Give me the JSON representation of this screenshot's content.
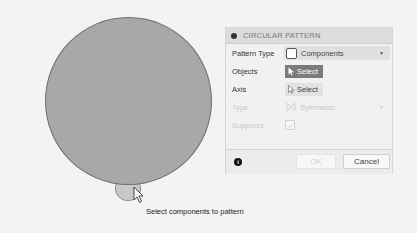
{
  "canvas": {
    "tooltip": "Select components to pattern",
    "colors": {
      "background": "#f3f3f3",
      "body_fill": "#a8a8a8",
      "component_fill": "#c9c9c9"
    }
  },
  "dialog": {
    "title": "CIRCULAR PATTERN",
    "rows": {
      "pattern_type": {
        "label": "Pattern Type",
        "value": "Components",
        "icon": "component-icon"
      },
      "objects": {
        "label": "Objects",
        "button": "Select",
        "state": "active"
      },
      "axis": {
        "label": "Axis",
        "button": "Select",
        "state": "inactive"
      },
      "type": {
        "label": "Type",
        "value": "Symmetric",
        "disabled": true
      },
      "suppress": {
        "label": "Suppress",
        "checked": true,
        "disabled": true
      }
    },
    "footer": {
      "info_icon": "info-icon",
      "ok_label": "OK",
      "cancel_label": "Cancel"
    },
    "colors": {
      "active_select": "#7b7b7b",
      "header": "#dcdcdc"
    }
  }
}
